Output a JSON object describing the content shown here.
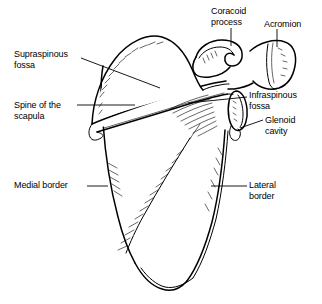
{
  "figure": {
    "subject": "scapula",
    "view": "posterior view",
    "line_color": "#000000",
    "background_color": "#ffffff"
  },
  "labels": {
    "supraspinous_fossa": "Supraspinous\nfossa",
    "spine_of_the_scapula": "Spine of the\nscapula",
    "medial_border": "Medial border",
    "coracoid_process": "Coracoid\nprocess",
    "acromion": "Acromion",
    "infraspinous_fossa": "Infraspinous\nfossa",
    "glenoid_cavity": "Glenoid\ncavity",
    "lateral_border": "Lateral\nborder"
  }
}
